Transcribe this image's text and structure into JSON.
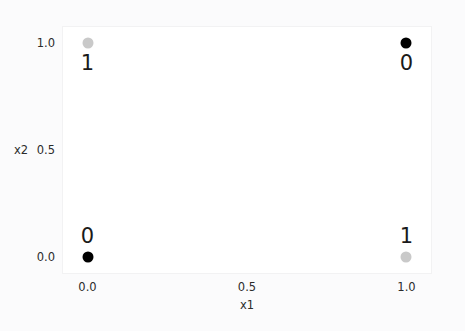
{
  "chart_data": {
    "type": "scatter",
    "title": "",
    "xlabel": "x1",
    "ylabel": "x2",
    "xlim": [
      -0.08,
      1.08
    ],
    "ylim": [
      -0.08,
      1.08
    ],
    "xticks": [
      "0.0",
      "0.5",
      "1.0"
    ],
    "xtick_values": [
      0.0,
      0.5,
      1.0
    ],
    "yticks": [
      "0.0",
      "0.5",
      "1.0"
    ],
    "ytick_values": [
      0.0,
      0.5,
      1.0
    ],
    "grid": false,
    "legend": null,
    "colors": {
      "class_0": "#000000",
      "class_1": "#c9c9c9",
      "plot_background": "#ffffff",
      "figure_background": "#fbfbfc",
      "frame": "#f2f2f3",
      "text": "#2b2b2b"
    },
    "points": [
      {
        "x": 0.0,
        "y": 0.0,
        "label": "0",
        "marker_color": "#000000",
        "color_class": "cls-black",
        "label_position": "above"
      },
      {
        "x": 0.0,
        "y": 1.0,
        "label": "1",
        "marker_color": "#c9c9c9",
        "color_class": "cls-gray",
        "label_position": "below"
      },
      {
        "x": 1.0,
        "y": 0.0,
        "label": "1",
        "marker_color": "#c9c9c9",
        "color_class": "cls-gray",
        "label_position": "above"
      },
      {
        "x": 1.0,
        "y": 1.0,
        "label": "0",
        "marker_color": "#000000",
        "color_class": "cls-black",
        "label_position": "below"
      }
    ]
  }
}
